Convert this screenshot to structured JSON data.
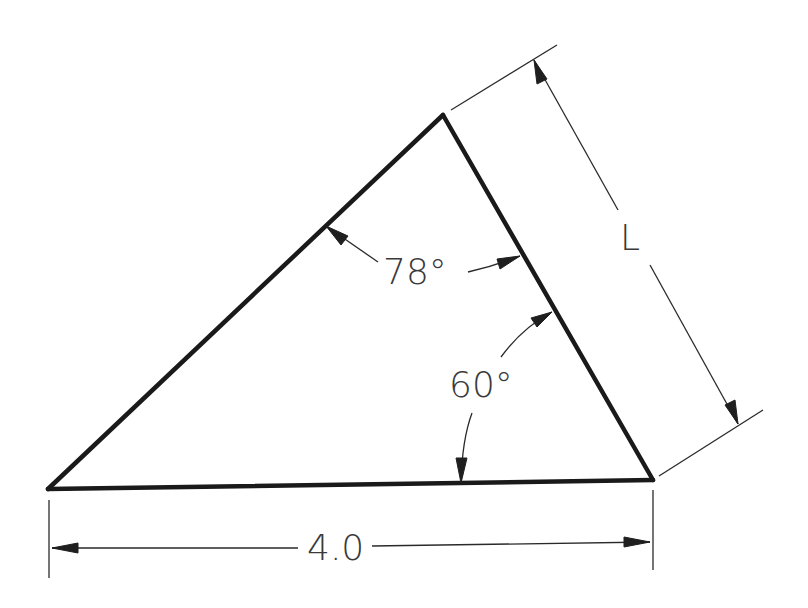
{
  "diagram": {
    "type": "triangle-dimension-drawing",
    "vertices": {
      "left": [
        48,
        489
      ],
      "top": [
        443,
        115
      ],
      "right": [
        653,
        480
      ]
    },
    "angles": [
      {
        "label": "78°",
        "at_vertex": "top",
        "value_deg": 78
      },
      {
        "label": "60°",
        "at_vertex": "right",
        "value_deg": 60
      }
    ],
    "dimensions": [
      {
        "label": "4.0",
        "measures": "base (left to right vertex)",
        "value": 4.0
      },
      {
        "label": "L",
        "measures": "right side (top to right vertex)",
        "value": null
      }
    ],
    "colors": {
      "edge": "#1a1a1a",
      "annotation": "#2a2a2a",
      "text": "#3a3a3a",
      "background": "#ffffff"
    }
  },
  "labels": {
    "angle_top": "78°",
    "angle_right": "60°",
    "base_length": "4.0",
    "side_length": "L"
  }
}
